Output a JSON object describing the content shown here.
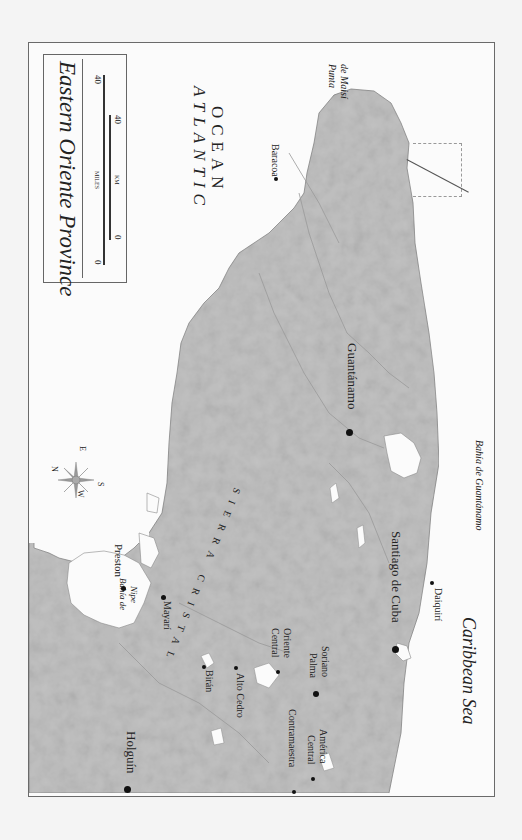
{
  "map": {
    "title": "Eastern Oriente Province",
    "orientation": "rotated 90° clockwise (north points left)",
    "colors": {
      "land": "#c2c2c2",
      "water": "#fbfbfb",
      "border": "#6a6a6a",
      "rivers": "#9a9a9a",
      "text": "#222222"
    },
    "scale_bar": {
      "miles_label": "MILES",
      "km_label": "KM",
      "miles_start": "0",
      "miles_end": "40",
      "km_start": "0",
      "km_end": "40"
    },
    "compass": {
      "n": "N",
      "s": "S",
      "e": "E",
      "w": "W"
    },
    "water_labels": {
      "atlantic_line1": "ATLANTIC",
      "atlantic_line2": "OCEAN",
      "caribbean": "Caribbean Sea"
    },
    "region_labels": {
      "sierra_cristal": "SIERRA CRISTAL",
      "punta_maisi_line1": "Punta",
      "punta_maisi_line2": "de Maisí",
      "bahia_nipe_line1": "Bahía de",
      "bahia_nipe_line2": "Nipe",
      "bahia_guantanamo": "Bahía de Guantánamo"
    },
    "cities": [
      {
        "name": "Baracoa",
        "size": "small"
      },
      {
        "name": "Guantánamo",
        "size": "large"
      },
      {
        "name": "Santiago de Cuba",
        "size": "large"
      },
      {
        "name": "Daiquirí",
        "size": "small"
      },
      {
        "name": "Preston",
        "size": "medium"
      },
      {
        "name": "Mayarí",
        "size": "medium"
      },
      {
        "name": "Birán",
        "size": "small"
      },
      {
        "name": "Alto Cedro",
        "size": "small"
      },
      {
        "name": "Central Oriente",
        "line1": "Central",
        "line2": "Oriente",
        "size": "small"
      },
      {
        "name": "Palma Soriano",
        "line1": "Palma",
        "line2": "Soriano",
        "size": "medium"
      },
      {
        "name": "Contramaestra",
        "size": "small"
      },
      {
        "name": "Central América",
        "line1": "Central",
        "line2": "América",
        "size": "small"
      },
      {
        "name": "Holguín",
        "size": "large"
      }
    ]
  }
}
